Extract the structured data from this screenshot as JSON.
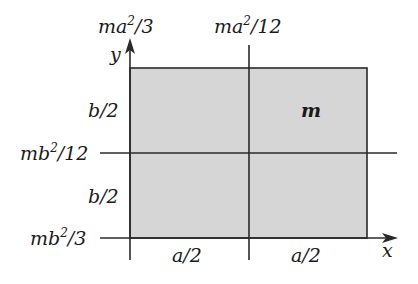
{
  "diagram": {
    "fill_color": "#d6d6d6",
    "line_color": "#2a2a2a",
    "axes": {
      "x_label": "x",
      "y_label": "y"
    },
    "mass_label": "m",
    "top_labels": [
      {
        "base": "ma",
        "exp": "2",
        "rest": "/3"
      },
      {
        "base": "ma",
        "exp": "2",
        "rest": "/12"
      }
    ],
    "left_labels": [
      {
        "base": "mb",
        "exp": "2",
        "rest": "/12"
      },
      {
        "base": "mb",
        "exp": "2",
        "rest": "/3"
      }
    ],
    "side_dims": [
      "b/2",
      "b/2"
    ],
    "bottom_dims": [
      "a/2",
      "a/2"
    ]
  }
}
